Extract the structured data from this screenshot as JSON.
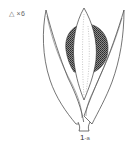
{
  "figure": {
    "scale_label": "△ ×6",
    "caption_main": "1",
    "caption_sub": "-a",
    "colors": {
      "line": "#3a3a3a",
      "stipple": "#4a4a4a",
      "background": "#ffffff"
    }
  }
}
